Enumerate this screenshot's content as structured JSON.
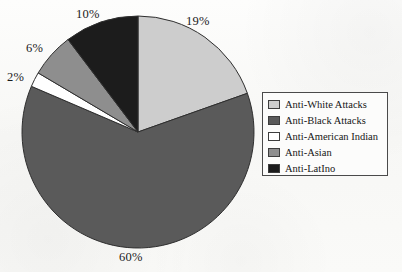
{
  "chart_data": {
    "type": "pie",
    "title": "",
    "xlabel": "",
    "ylabel": "",
    "legend_position": "right",
    "grid": false,
    "units": "percent",
    "categories": [
      "Anti-White Attacks",
      "Anti-Black Attacks",
      "Anti-American Indian",
      "Anti-Asian",
      "Anti-LatIno"
    ],
    "values": [
      19,
      60,
      2,
      6,
      10
    ],
    "data_labels": [
      "19%",
      "60%",
      "2%",
      "6%",
      "10%"
    ],
    "colors": [
      "#cdcdcd",
      "#5a5a5a",
      "#ffffff",
      "#8e8e8e",
      "#1c1c1c"
    ],
    "start_angle_deg": 0,
    "direction": "clockwise",
    "slices": [
      {
        "label": "Anti-White Attacks",
        "value": 19,
        "data_label": "19%",
        "color": "#cdcdcd"
      },
      {
        "label": "Anti-Black Attacks",
        "value": 60,
        "data_label": "60%",
        "color": "#5a5a5a"
      },
      {
        "label": "Anti-American Indian",
        "value": 2,
        "data_label": "2%",
        "color": "#ffffff"
      },
      {
        "label": "Anti-Asian",
        "value": 6,
        "data_label": "6%",
        "color": "#8e8e8e"
      },
      {
        "label": "Anti-LatIno",
        "value": 10,
        "data_label": "10%",
        "color": "#1c1c1c"
      }
    ]
  },
  "labels": {
    "anti_white": "19%",
    "anti_black": "60%",
    "anti_american_indian": "2%",
    "anti_asian": "6%",
    "anti_latino": "10%"
  },
  "legend": {
    "items": [
      {
        "label": "Anti-White Attacks",
        "color": "#cdcdcd"
      },
      {
        "label": "Anti-Black Attacks",
        "color": "#5a5a5a"
      },
      {
        "label": "Anti-American Indian",
        "color": "#ffffff"
      },
      {
        "label": "Anti-Asian",
        "color": "#8e8e8e"
      },
      {
        "label": "Anti-LatIno",
        "color": "#1c1c1c"
      }
    ]
  }
}
